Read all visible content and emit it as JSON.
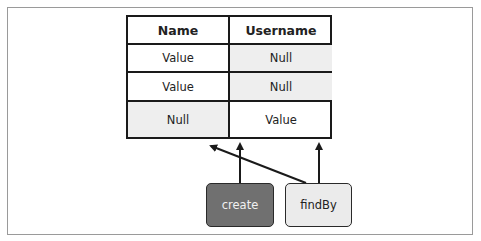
{
  "table": {
    "headers": [
      "Name",
      "Username"
    ],
    "rows": [
      {
        "name": "Value",
        "username": "Null"
      },
      {
        "name": "Value",
        "username": "Null"
      },
      {
        "name": "Null",
        "username": "Value"
      }
    ]
  },
  "operations": {
    "create": "create",
    "findBy": "findBy"
  },
  "colors": {
    "create_fill": "#707070",
    "findBy_fill": "#ebebeb",
    "null_cell_fill": "#eeeeee",
    "line": "#1a1a1a"
  }
}
